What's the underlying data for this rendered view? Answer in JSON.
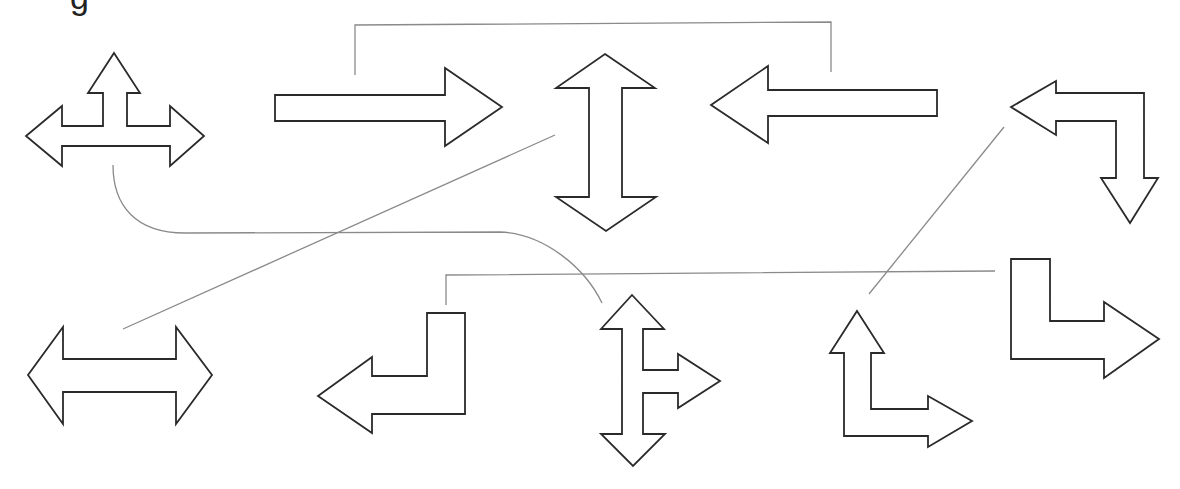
{
  "figure": {
    "clipped_caption_fragment": "g",
    "background": "#ffffff",
    "stroke_color": "#2a2a2a",
    "connector_color": "#8a8a8a"
  },
  "shapes": [
    {
      "id": "t-arrow-left-up-right",
      "kind": "three-way arrow",
      "directions": [
        "left",
        "up",
        "right"
      ],
      "points": "114,53 140,93 127,93 127,126 170,126 170,106 204,136 170,166 170,146 62,146 62,166 26,136 62,106 62,126 103,126 103,93 88,93"
    },
    {
      "id": "arrow-right",
      "kind": "single arrow",
      "directions": [
        "right"
      ],
      "points": "275,95 445,95 445,68 502,107 445,146 445,121 275,121"
    },
    {
      "id": "double-arrow-vertical",
      "kind": "double arrow",
      "directions": [
        "up",
        "down"
      ],
      "points": "605,54 655,88 622,88 622,197 656,197 606,231 556,197 589,197 589,88 556,88"
    },
    {
      "id": "arrow-left",
      "kind": "single arrow",
      "directions": [
        "left"
      ],
      "points": "711,105 768,66 768,90 937,90 937,116 768,116 768,143"
    },
    {
      "id": "l-arrow-left-down",
      "kind": "bent arrow",
      "directions": [
        "left",
        "down"
      ],
      "points": "1011,107 1056,81 1056,93 1144,93 1144,178 1158,178 1130,223 1101,178 1116,178 1116,121 1056,121 1056,135"
    },
    {
      "id": "double-arrow-horizontal",
      "kind": "double arrow",
      "directions": [
        "left",
        "right"
      ],
      "points": "28,375 63,327 63,359 176,359 176,327 212,375 176,424 176,392 63,392 63,424"
    },
    {
      "id": "hook-arrow-left",
      "kind": "bent arrow",
      "directions": [
        "down",
        "left"
      ],
      "points": "427,313 465,313 465,414 372,414 372,433 318,396 372,357 372,376 427,376"
    },
    {
      "id": "t-arrow-up-down-right",
      "kind": "three-way arrow",
      "directions": [
        "up",
        "down",
        "right"
      ],
      "points": "632,295 664,329 643,329 643,370 678,370 678,354 720,381 678,408 678,393 643,393 643,434 665,434 633,466 601,434 622,434 622,329 601,329"
    },
    {
      "id": "l-arrow-up-right",
      "kind": "bent arrow",
      "directions": [
        "up",
        "right"
      ],
      "points": "857,311 884,353 871,353 871,409 928,409 928,396 972,421 928,447 928,436 844,436 844,353 830,353"
    },
    {
      "id": "l-arrow-down-right",
      "kind": "bent arrow",
      "directions": [
        "down",
        "right"
      ],
      "points": "1011,259 1050,259 1050,321 1104,321 1104,302 1159,339 1104,378 1104,359 1011,359"
    }
  ],
  "connectors": [
    {
      "id": "bracket-top",
      "kind": "bracket",
      "from": "arrow-right",
      "to": "arrow-left",
      "d": "M355,75 L355,25 L831,22 L831,72"
    },
    {
      "id": "diagonal-long",
      "kind": "straight line",
      "from": "double-arrow-horizontal",
      "to": "double-arrow-vertical",
      "d": "M123,329 L555,135"
    },
    {
      "id": "curve-tarrow",
      "kind": "curved line",
      "from": "t-arrow-left-up-right",
      "to": "t-arrow-up-down-right",
      "d": "M113,165 C113,205 135,233 185,233 L500,232 C545,234 585,268 602,303"
    },
    {
      "id": "bracket-bottom",
      "kind": "bracket",
      "from": "hook-arrow-left",
      "to": "l-arrow-down-right",
      "d": "M446,305 L446,275 L995,271"
    },
    {
      "id": "diagonal-right",
      "kind": "straight line",
      "from": "l-arrow-up-right",
      "to": "l-arrow-left-down",
      "d": "M869,294 L1004,127"
    }
  ]
}
